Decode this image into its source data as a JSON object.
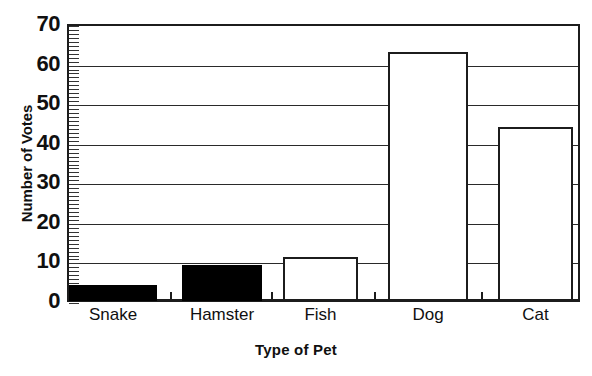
{
  "chart_data": {
    "type": "bar",
    "title": "",
    "categories": [
      "Snake",
      "Hamster",
      "Fish",
      "Dog",
      "Cat"
    ],
    "values": [
      4,
      9,
      11,
      63,
      44
    ],
    "xlabel": "Type of Pet",
    "ylabel": "Number of Votes",
    "ylim": [
      0,
      70
    ],
    "ytick_labels": [
      "0",
      "10",
      "20",
      "30",
      "40",
      "50",
      "60",
      "70"
    ],
    "ytick_values": [
      0,
      10,
      20,
      30,
      40,
      50,
      60,
      70
    ],
    "yminor_tick_step": 1,
    "grid": "horizontal-major",
    "legend": "none",
    "bar_styles": [
      "filled",
      "filled",
      "hollow",
      "hollow",
      "hollow"
    ],
    "colors": {
      "fill_solid": "#000000",
      "fill_hollow": "#ffffff",
      "outline": "#1c1c1c",
      "background": "#ffffff",
      "gridline": "#2a2a2a"
    }
  }
}
